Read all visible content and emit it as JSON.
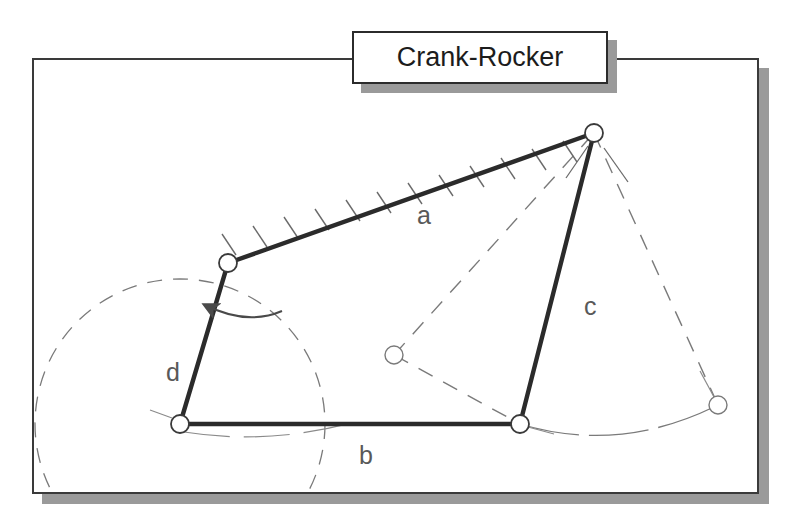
{
  "title": {
    "label": "Crank-Rocker"
  },
  "diagram": {
    "type": "four-bar-linkage-kinematic-diagram",
    "link_labels": [
      {
        "id": "a",
        "label": "a",
        "role": "coupler",
        "x": 385,
        "y": 166
      },
      {
        "id": "b",
        "label": "b",
        "role": "ground",
        "x": 327,
        "y": 406
      },
      {
        "id": "c",
        "label": "c",
        "role": "rocker",
        "x": 552,
        "y": 257
      },
      {
        "id": "d",
        "label": "d",
        "role": "crank",
        "x": 134,
        "y": 323
      }
    ],
    "joints": [
      {
        "id": "crank-ground-pivot",
        "x": 148,
        "y": 366,
        "style": "solid",
        "radius": 9
      },
      {
        "id": "crank-coupler-pin",
        "x": 196,
        "y": 205,
        "style": "solid",
        "radius": 9
      },
      {
        "id": "coupler-rocker-pin",
        "x": 562,
        "y": 75,
        "style": "solid",
        "radius": 9
      },
      {
        "id": "rocker-ground-pivot",
        "x": 488,
        "y": 366,
        "style": "solid",
        "radius": 9
      },
      {
        "id": "alt-crank-coupler-pin",
        "x": 362,
        "y": 297,
        "style": "thin",
        "radius": 9
      },
      {
        "id": "alt-rocker-tip",
        "x": 686,
        "y": 347,
        "style": "thin",
        "radius": 9
      }
    ],
    "solid_links": [
      {
        "id": "link-d-crank",
        "from": "crank-ground-pivot",
        "to": "crank-coupler-pin"
      },
      {
        "id": "link-a-coupler",
        "from": "crank-coupler-pin",
        "to": "coupler-rocker-pin"
      },
      {
        "id": "link-c-rocker",
        "from": "coupler-rocker-pin",
        "to": "rocker-ground-pivot"
      },
      {
        "id": "link-b-ground",
        "from": "crank-ground-pivot",
        "to": "rocker-ground-pivot"
      }
    ],
    "dashed_elements": [
      {
        "id": "crank-circle-path",
        "kind": "circle",
        "cx": 148,
        "cy": 366,
        "r": 145
      },
      {
        "id": "alt-coupler-line",
        "kind": "line",
        "from": "alt-crank-coupler-pin",
        "to": "coupler-rocker-pin"
      },
      {
        "id": "alt-rocker-line",
        "kind": "line",
        "from": "coupler-rocker-pin",
        "to": "alt-rocker-tip"
      },
      {
        "id": "alt-crank-line",
        "kind": "line",
        "from": "alt-crank-coupler-pin",
        "to": "rocker-ground-pivot"
      },
      {
        "id": "rocker-swing-arc",
        "kind": "arc",
        "from": "rocker-ground-pivot",
        "to": "alt-rocker-tip"
      }
    ],
    "hatching": {
      "id": "coupler-hatch-marks",
      "on_link": "link-a-coupler",
      "side": "above",
      "count": 12
    },
    "rotation_arrow": {
      "id": "crank-rotation-arrow",
      "direction": "counterclockwise"
    }
  },
  "colors": {
    "ink": "#1c1c1c",
    "link": "#2b2b2b",
    "thin": "#6e6e6e",
    "label": "#595959",
    "shadow": "#9a9a9a",
    "paper": "#ffffff"
  }
}
